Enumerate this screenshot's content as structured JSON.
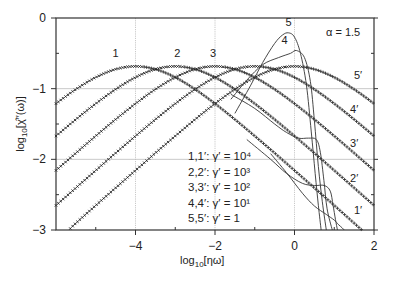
{
  "chart_data": {
    "type": "line",
    "title": "",
    "annotation": "α = 1.5",
    "xlabel": "log10[ηω]",
    "ylabel": "log10[χ̂''(ω)]",
    "xlim": [
      -6,
      2
    ],
    "ylim": [
      -3,
      0
    ],
    "x_ticks": [
      -4,
      -2,
      0,
      2
    ],
    "x_tick_labels": [
      "−4",
      "−2",
      "0",
      "2"
    ],
    "x_minor_ticks": [
      -5,
      -3,
      -1,
      1
    ],
    "y_ticks": [
      0,
      -1,
      -2,
      -3
    ],
    "y_tick_labels": [
      "0",
      "−1",
      "−2",
      "−3"
    ],
    "y_minor_ticks": [
      -0.5,
      -1.5,
      -2.5
    ],
    "grid": {
      "x": [
        -4,
        -2,
        0
      ],
      "y": [
        -1,
        -2
      ]
    },
    "legend": [
      "1,1′: γ′ = 10⁴",
      "2,2′: γ′ = 10³",
      "3,3′: γ′ = 10²",
      "4,4′: γ′ = 10¹",
      "5,5′: γ′ = 1"
    ],
    "peak_curve_offsets_d": [
      -6,
      -5.5,
      -5,
      -4.5,
      -4,
      -3.5,
      -3,
      -2.5,
      -2,
      -1.5,
      -1,
      -0.5,
      0,
      0.5,
      1,
      1.5,
      2,
      2.5,
      3,
      3.5,
      4,
      4.5,
      5,
      5.5,
      6,
      6.5,
      7,
      7.5,
      8
    ],
    "peak_curve_values": [
      -3.151,
      -2.903,
      -2.652,
      -2.404,
      -2.157,
      -1.911,
      -1.67,
      -1.435,
      -1.212,
      -1.009,
      -0.84,
      -0.725,
      -0.684,
      -0.725,
      -0.84,
      -1.009,
      -1.212,
      -1.435,
      -1.67,
      -1.911,
      -2.157,
      -2.404,
      -2.652,
      -2.903,
      -3.151,
      -3.4,
      -3.65,
      -3.9,
      -4.15
    ],
    "marker_series": [
      {
        "name": "1 / 1′",
        "label": "1",
        "prime_label": "1′",
        "peak_x": -4,
        "peak_y": -0.684
      },
      {
        "name": "2 / 2′",
        "label": "2",
        "prime_label": "2′",
        "peak_x": -3,
        "peak_y": -0.684
      },
      {
        "name": "3 / 3′",
        "label": "3",
        "prime_label": "3′",
        "peak_x": -2,
        "peak_y": -0.684
      },
      {
        "name": "4 / 4′",
        "label": "4",
        "prime_label": "4′",
        "peak_x": -1,
        "peak_y": -0.684
      },
      {
        "name": "5 / 5′",
        "label": "5",
        "prime_label": "5′",
        "peak_x": 0,
        "peak_y": -0.684
      }
    ],
    "solid_series": [
      {
        "name": "1",
        "x": [
          -0.6,
          -0.2,
          0.2,
          0.5,
          0.8,
          1.0,
          1.1,
          1.2,
          1.25
        ],
        "y": [
          -1.92,
          -2.19,
          -2.48,
          -2.66,
          -2.78,
          -2.86,
          -2.92,
          -2.97,
          -3.0
        ]
      },
      {
        "name": "2",
        "x": [
          -1.2,
          -0.6,
          -0.2,
          0.2,
          0.5,
          0.75,
          0.9,
          0.97,
          1.03,
          1.08
        ],
        "y": [
          -1.72,
          -2.0,
          -2.2,
          -2.34,
          -2.37,
          -2.37,
          -2.45,
          -2.65,
          -2.85,
          -3.0
        ]
      },
      {
        "name": "3",
        "x": [
          -1.6,
          -1.0,
          -0.5,
          -0.2,
          0.1,
          0.35,
          0.55,
          0.65,
          0.74,
          0.82,
          0.95
        ],
        "y": [
          -1.08,
          -1.28,
          -1.5,
          -1.62,
          -1.7,
          -1.7,
          -1.72,
          -1.9,
          -2.3,
          -2.7,
          -3.0
        ]
      },
      {
        "name": "4",
        "x": [
          -1.6,
          -1.2,
          -0.8,
          -0.4,
          -0.1,
          0.05,
          0.25,
          0.4,
          0.5,
          0.6,
          0.7,
          0.8
        ],
        "y": [
          -1.15,
          -0.88,
          -0.66,
          -0.56,
          -0.5,
          -0.46,
          -0.56,
          -0.9,
          -1.45,
          -2.1,
          -2.6,
          -3.0
        ]
      },
      {
        "name": "5",
        "x": [
          -1.5,
          -1.1,
          -0.8,
          -0.5,
          -0.3,
          -0.15,
          0.0,
          0.15,
          0.3,
          0.42,
          0.52,
          0.6,
          0.67
        ],
        "y": [
          -1.35,
          -0.95,
          -0.63,
          -0.36,
          -0.24,
          -0.21,
          -0.27,
          -0.5,
          -0.95,
          -1.6,
          -2.2,
          -2.65,
          -3.0
        ]
      }
    ],
    "solid_labels": [
      {
        "text": "5",
        "x": -0.15,
        "y": -0.12
      },
      {
        "text": "4",
        "x": -0.25,
        "y": -0.37
      }
    ],
    "unprimed_labels": [
      {
        "text": "1",
        "x": -4.5,
        "y": -0.55
      },
      {
        "text": "2",
        "x": -2.95,
        "y": -0.55
      },
      {
        "text": "3",
        "x": -2.05,
        "y": -0.55
      }
    ],
    "primed_labels": [
      {
        "text": "5′",
        "x": 1.6,
        "y": -0.87
      },
      {
        "text": "4′",
        "x": 1.5,
        "y": -1.35
      },
      {
        "text": "3′",
        "x": 1.5,
        "y": -1.82
      },
      {
        "text": "2′",
        "x": 1.5,
        "y": -2.32
      },
      {
        "text": "1′",
        "x": 1.6,
        "y": -2.78
      }
    ]
  }
}
